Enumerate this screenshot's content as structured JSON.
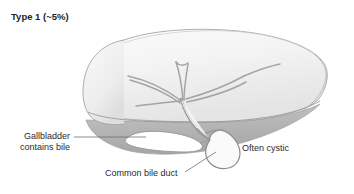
{
  "figure": {
    "title": "Type 1 (~5%)"
  },
  "labels": {
    "gallbladder": "Gallbladder\ncontains bile",
    "common_bile_duct": "Common bile duct",
    "often_cystic": "Often cystic"
  },
  "colors": {
    "liver_top": "#f2f2f2",
    "liver_underside": "#b9b9b9",
    "duct_stroke": "#9a9a9a",
    "outline": "#8c8c8c",
    "text": "#2b2b2b",
    "leader": "#6f6f6f",
    "gallbladder_fill": "#ffffff"
  }
}
